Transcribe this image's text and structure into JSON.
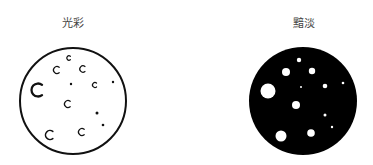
{
  "left": {
    "label": "光彩",
    "style": "outline",
    "stroke_color": "#111111",
    "fill_color": "#ffffff",
    "circle": {
      "cx": 73,
      "cy": 101,
      "r": 53
    },
    "spots": [
      {
        "type": "crescent",
        "cx": 38,
        "cy": 90,
        "r": 6.5
      },
      {
        "type": "crescent",
        "cx": 57,
        "cy": 70,
        "r": 3.5
      },
      {
        "type": "crescent",
        "cx": 69,
        "cy": 58,
        "r": 2.2
      },
      {
        "type": "crescent",
        "cx": 83,
        "cy": 69,
        "r": 3.2
      },
      {
        "type": "dot",
        "cx": 71,
        "cy": 84,
        "r": 1.2
      },
      {
        "type": "crescent",
        "cx": 95,
        "cy": 85,
        "r": 2.5
      },
      {
        "type": "dot",
        "cx": 113,
        "cy": 82,
        "r": 1.2
      },
      {
        "type": "crescent",
        "cx": 68,
        "cy": 104,
        "r": 3.5
      },
      {
        "type": "dot",
        "cx": 97,
        "cy": 113,
        "r": 1.5
      },
      {
        "type": "dot",
        "cx": 103,
        "cy": 125,
        "r": 1.3
      },
      {
        "type": "crescent",
        "cx": 50,
        "cy": 135,
        "r": 4.5
      },
      {
        "type": "crescent",
        "cx": 82,
        "cy": 132,
        "r": 3.5
      }
    ]
  },
  "right": {
    "label": "黯淡",
    "style": "filled",
    "fill_color": "#000000",
    "spot_color": "#ffffff",
    "circle": {
      "cx": 303,
      "cy": 101,
      "r": 54
    },
    "spots": [
      {
        "cx": 268,
        "cy": 91,
        "r": 7.5
      },
      {
        "cx": 286,
        "cy": 72,
        "r": 4
      },
      {
        "cx": 299,
        "cy": 60,
        "r": 2.2
      },
      {
        "cx": 312,
        "cy": 71,
        "r": 3.2
      },
      {
        "cx": 301,
        "cy": 87,
        "r": 1
      },
      {
        "cx": 325,
        "cy": 86,
        "r": 2.3
      },
      {
        "cx": 343,
        "cy": 83,
        "r": 1.3
      },
      {
        "cx": 296,
        "cy": 105,
        "r": 4
      },
      {
        "cx": 325,
        "cy": 115,
        "r": 1.5
      },
      {
        "cx": 332,
        "cy": 127,
        "r": 1.2
      },
      {
        "cx": 281,
        "cy": 136,
        "r": 5.5
      },
      {
        "cx": 311,
        "cy": 133,
        "r": 3.8
      }
    ]
  }
}
